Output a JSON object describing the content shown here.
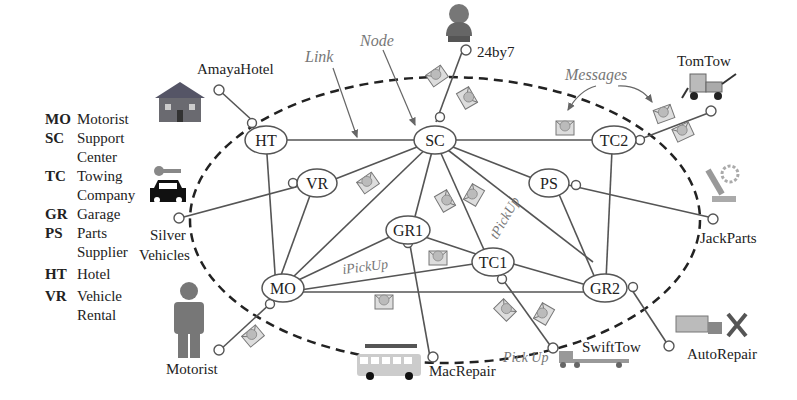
{
  "legend": [
    {
      "abbr": "MO",
      "desc": [
        "Motorist"
      ]
    },
    {
      "abbr": "SC",
      "desc": [
        "Support",
        "Center"
      ]
    },
    {
      "abbr": "TC",
      "desc": [
        "Towing",
        "Company"
      ]
    },
    {
      "abbr": "GR",
      "desc": [
        "Garage"
      ]
    },
    {
      "abbr": "PS",
      "desc": [
        "Parts",
        "Supplier"
      ]
    },
    {
      "abbr": "HT",
      "desc": [
        "Hotel"
      ]
    },
    {
      "abbr": "VR",
      "desc": [
        "Vehicle",
        "Rental"
      ]
    }
  ],
  "annotations": {
    "link": "Link",
    "node": "Node",
    "messages": "Messages",
    "ipickup": "iPickUp",
    "tpickup": "tPickUp",
    "pickup": "Pick Up"
  },
  "nodes": {
    "HT": "HT",
    "SC": "SC",
    "TC2": "TC2",
    "VR": "VR",
    "PS": "PS",
    "GR1": "GR1",
    "TC1": "TC1",
    "MO": "MO",
    "GR2": "GR2"
  },
  "external": {
    "amaya": "AmayaHotel",
    "support247": "24by7",
    "tomtow": "TomTow",
    "silver1": "Silver",
    "silver2": "Vehicles",
    "jackparts": "JackParts",
    "motorist": "Motorist",
    "macrepair": "MacRepair",
    "swifttow": "SwiftTow",
    "autorepair": "AutoRepair"
  }
}
